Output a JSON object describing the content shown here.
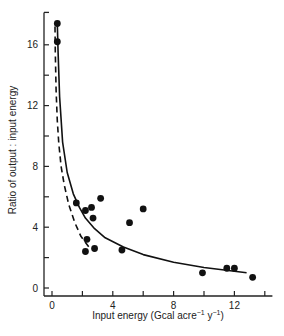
{
  "chart_data": {
    "type": "scatter",
    "title": "",
    "xlabel": "Input energy (Gcal acre",
    "xlabel_unit_parts": [
      {
        "text": "Input energy (Gcal acre",
        "sup": false
      },
      {
        "text": "−1",
        "sup": true
      },
      {
        "text": " y",
        "sup": false
      },
      {
        "text": "−1",
        "sup": true
      },
      {
        "text": ")",
        "sup": false
      }
    ],
    "ylabel": "Ratio of output : input energy",
    "xlim": [
      0,
      14.5
    ],
    "ylim": [
      0,
      18
    ],
    "x_ticks": [
      0,
      2,
      4,
      6,
      8,
      10,
      12,
      14
    ],
    "x_tick_labels": [
      "0",
      "",
      "4",
      "",
      "8",
      "",
      "12",
      ""
    ],
    "y_ticks": [
      0,
      2,
      4,
      6,
      8,
      10,
      12,
      14,
      16,
      18
    ],
    "y_tick_labels": [
      "0",
      "",
      "4",
      "",
      "8",
      "",
      "12",
      "",
      "16",
      ""
    ],
    "grid": false,
    "points": [
      {
        "x": 0.35,
        "y": 17.4
      },
      {
        "x": 0.35,
        "y": 16.2
      },
      {
        "x": 1.6,
        "y": 5.6
      },
      {
        "x": 2.2,
        "y": 5.1
      },
      {
        "x": 2.6,
        "y": 5.3
      },
      {
        "x": 3.2,
        "y": 5.9
      },
      {
        "x": 2.7,
        "y": 4.6
      },
      {
        "x": 2.3,
        "y": 3.2
      },
      {
        "x": 2.2,
        "y": 2.4
      },
      {
        "x": 2.8,
        "y": 2.6
      },
      {
        "x": 4.6,
        "y": 2.5
      },
      {
        "x": 5.1,
        "y": 4.3
      },
      {
        "x": 6.0,
        "y": 5.2
      },
      {
        "x": 9.9,
        "y": 1.0
      },
      {
        "x": 11.5,
        "y": 1.3
      },
      {
        "x": 12.0,
        "y": 1.3
      },
      {
        "x": 13.2,
        "y": 0.7
      }
    ],
    "series": [
      {
        "name": "fitted-curve-solid",
        "style": "solid",
        "x": [
          0.35,
          0.4,
          0.5,
          0.7,
          1.0,
          1.4,
          1.8,
          2.2,
          2.8,
          3.5,
          4.7,
          6.0,
          8.0,
          10.0,
          12.8
        ],
        "y": [
          17.4,
          15.5,
          12.6,
          9.6,
          7.6,
          6.2,
          5.3,
          4.6,
          3.9,
          3.3,
          2.7,
          2.2,
          1.7,
          1.35,
          1.0
        ]
      },
      {
        "name": "fitted-curve-dashed",
        "style": "dashed",
        "x": [
          0.2,
          0.22,
          0.27,
          0.35,
          0.45,
          0.6,
          0.8,
          1.1,
          1.5,
          1.9,
          2.5
        ],
        "y": [
          17.2,
          15.5,
          13.0,
          11.0,
          9.5,
          8.0,
          6.8,
          5.5,
          4.3,
          3.4,
          2.6
        ]
      }
    ]
  }
}
